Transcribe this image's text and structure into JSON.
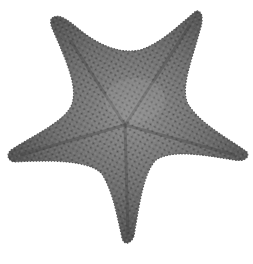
{
  "image": {
    "subject": "starfish",
    "description": "Grayscale photograph of a five-armed cushion sea star on a white background",
    "background_color": "#ffffff",
    "colors": {
      "body_dark": "#4a4a4a",
      "body_mid": "#6e6e6e",
      "body_light": "#8f8f8f",
      "tubercle": "#2e2e2e"
    },
    "arms": [
      {
        "name": "top-left",
        "tip": [
          54,
          17
        ]
      },
      {
        "name": "top-right",
        "tip": [
          196,
          11
        ]
      },
      {
        "name": "right",
        "tip": [
          247,
          157
        ]
      },
      {
        "name": "bottom",
        "tip": [
          128,
          243
        ]
      },
      {
        "name": "left",
        "tip": [
          9,
          155
        ]
      }
    ],
    "center": [
      125,
      125
    ]
  }
}
